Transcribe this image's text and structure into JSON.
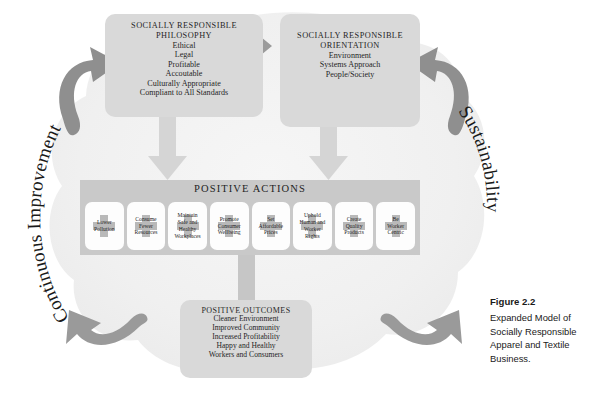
{
  "figure": {
    "number_label": "Figure 2.2",
    "caption": "Expanded Model of Socially Responsible Apparel and Textile Business."
  },
  "cycle_labels": {
    "left": "Continuous Improvement",
    "right": "Sustainability"
  },
  "philosophy": {
    "title": "SOCIALLY RESPONSIBLE\nPHILOSOPHY",
    "items": [
      "Ethical",
      "Legal",
      "Profitable",
      "Accoutable",
      "Culturally Appropriate",
      "Compliant to All Standards"
    ]
  },
  "orientation": {
    "title": "SOCIALLY RESPONSIBLE\nORIENTATION",
    "items": [
      "Environment",
      "Systems Approach",
      "People/Society"
    ]
  },
  "actions": {
    "title": "POSITIVE ACTIONS",
    "items": [
      {
        "lines": [
          "Lower",
          "Pollution"
        ]
      },
      {
        "lines": [
          "Consume",
          "Fewer",
          "Resources"
        ]
      },
      {
        "lines": [
          "Maintain",
          "Safe and",
          "Healthy",
          "Workplaces"
        ]
      },
      {
        "lines": [
          "Promote",
          "Consumer",
          "Wellbeing"
        ]
      },
      {
        "lines": [
          "Set",
          "Affordable",
          "Prices"
        ]
      },
      {
        "lines": [
          "Uphold",
          "Human and",
          "Worker",
          "Rights"
        ]
      },
      {
        "lines": [
          "Create",
          "Quality",
          "Products"
        ]
      },
      {
        "lines": [
          "Be",
          "Worker",
          "Centric"
        ]
      }
    ]
  },
  "outcomes": {
    "title": "POSITIVE OUTCOMES",
    "items": [
      "Cleaner Environment",
      "Improved Community",
      "Increased Profitability",
      "Happy and Healthy",
      "Workers and Consumers"
    ]
  },
  "colors": {
    "cloud_fill": "#f1f1f1",
    "box_fill": "#d9d9d9",
    "band_fill": "#c9c9c9",
    "cell_fill": "#fdfdfd",
    "cross_fill": "#b9b9b9",
    "arrow_light": "#d6d6d6",
    "arrow_dark": "#8c8c8c",
    "text": "#1f1f1f"
  }
}
